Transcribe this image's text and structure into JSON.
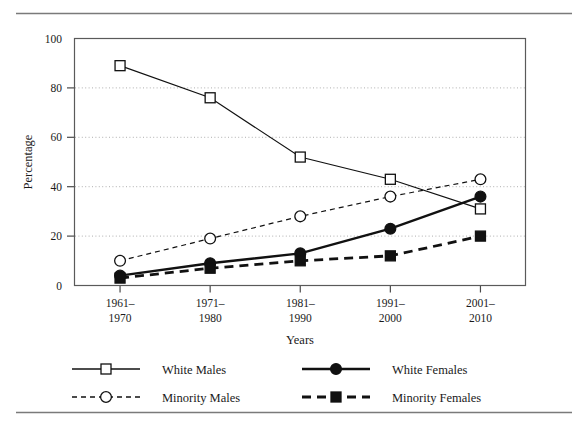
{
  "figure": {
    "background_color": "#ffffff",
    "rule_color": "#7a7a7a",
    "frame_color": "#5a5a5a",
    "ink_color": "#111111",
    "top_rule": true,
    "bottom_rule": true
  },
  "chart_data": {
    "type": "line",
    "title": "",
    "xlabel": "Years",
    "ylabel": "Percentage",
    "categories": [
      "1961–1970",
      "1971–1980",
      "1981–1990",
      "1991–2000",
      "2001–2010"
    ],
    "category_lines": [
      [
        "1961–",
        "1970"
      ],
      [
        "1971–",
        "1980"
      ],
      [
        "1981–",
        "1990"
      ],
      [
        "1991–",
        "2000"
      ],
      [
        "2001–",
        "2010"
      ]
    ],
    "ylim": [
      0,
      100
    ],
    "yticks": [
      0,
      20,
      40,
      60,
      80,
      100
    ],
    "ytick_labels": [
      "0",
      "20",
      "40",
      "60",
      "80",
      "100"
    ],
    "grid": true,
    "grid_at": [
      20,
      40,
      60,
      80
    ],
    "legend_position": "bottom",
    "series": [
      {
        "name": "White Males",
        "values": [
          89,
          76,
          52,
          43,
          31
        ],
        "marker": "open-square",
        "line_style": "solid",
        "line_width": 1.2
      },
      {
        "name": "Minority Males",
        "values": [
          10,
          19,
          28,
          36,
          43
        ],
        "marker": "open-circle",
        "line_style": "dashed-fine",
        "line_width": 1.2
      },
      {
        "name": "White Females",
        "values": [
          4,
          9,
          13,
          23,
          36
        ],
        "marker": "filled-circle",
        "line_style": "solid",
        "line_width": 2.4
      },
      {
        "name": "Minority Females",
        "values": [
          3,
          7,
          10,
          12,
          20
        ],
        "marker": "filled-square",
        "line_style": "dashed-bold",
        "line_width": 2.8
      }
    ]
  },
  "legend": {
    "entries": [
      {
        "label": "White Males",
        "marker": "open-square",
        "line_style": "solid"
      },
      {
        "label": "White Females",
        "marker": "filled-circle",
        "line_style": "solid"
      },
      {
        "label": "Minority Males",
        "marker": "open-circle",
        "line_style": "dashed-fine"
      },
      {
        "label": "Minority Females",
        "marker": "filled-square",
        "line_style": "dashed-bold"
      }
    ]
  }
}
